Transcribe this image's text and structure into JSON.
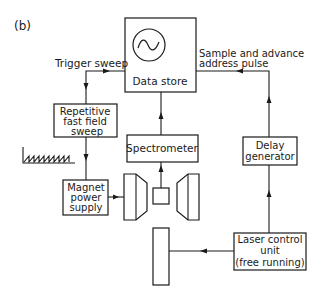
{
  "figure": {
    "panel_label": "(b)",
    "blocks": {
      "data_store": {
        "label": "Data store",
        "icon": "sine-wave-display-icon"
      },
      "repetitive_sweep": {
        "line1": "Repetitive",
        "line2": "fast field",
        "line3": "sweep"
      },
      "magnet_power_supply": {
        "line1": "Magnet",
        "line2": "power",
        "line3": "supply"
      },
      "spectrometer": {
        "label": "Spectrometer"
      },
      "delay_generator": {
        "line1": "Delay",
        "line2": "generator"
      },
      "laser_control_unit": {
        "line1": "Laser control",
        "line2": "unit",
        "line3": "(free running)"
      }
    },
    "signals": {
      "trigger_sweep": "Trigger sweep",
      "sample_advance_line1": "Sample and advance",
      "sample_advance_line2": "address pulse"
    },
    "icons": {
      "sawtooth": "sawtooth-waveform-icon",
      "magnet_poles": "magnet-pole-icon",
      "sample_cell": "sample-cell-icon",
      "laser_cell": "laser-cell-icon"
    },
    "colors": {
      "ink": "#1a1a1a",
      "background": "#ffffff"
    }
  }
}
